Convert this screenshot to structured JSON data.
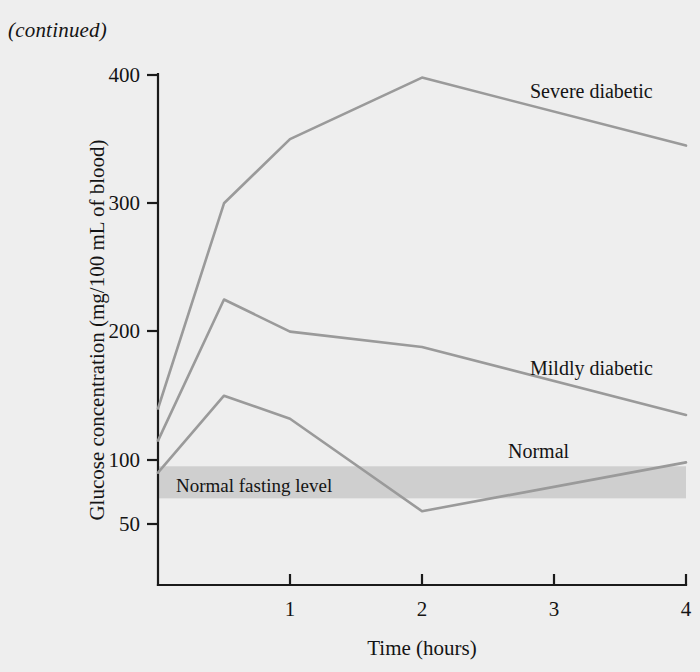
{
  "page": {
    "continued_note": "(continued)",
    "background_color": "#eeeeee"
  },
  "chart_data": {
    "type": "line",
    "title": "",
    "xlabel": "Time (hours)",
    "ylabel": "Glucose concentration (mg/100 mL of blood)",
    "xlim": [
      0,
      4
    ],
    "ylim": [
      30,
      400
    ],
    "xticks": [
      "1",
      "2",
      "3",
      "4"
    ],
    "xtick_values": [
      1,
      2,
      3,
      4
    ],
    "yticks": [
      "400",
      "300",
      "200",
      "100",
      "50"
    ],
    "ytick_values": [
      400,
      300,
      200,
      100,
      50
    ],
    "grid": false,
    "legend_position": "inline-right",
    "x": [
      0,
      0.5,
      1,
      2,
      4
    ],
    "series": [
      {
        "name": "Severe diabetic",
        "color": "#9a9a9a",
        "values": [
          140,
          300,
          350,
          398,
          345
        ],
        "label_x": 3.05,
        "label_y": 372
      },
      {
        "name": "Mildly diabetic",
        "color": "#9a9a9a",
        "values": [
          115,
          225,
          200,
          188,
          135
        ],
        "label_x": 3.05,
        "label_y": 172
      },
      {
        "name": "Normal",
        "color": "#9a9a9a",
        "values": [
          90,
          150,
          132,
          60,
          98
        ],
        "label_x": 3.0,
        "label_y": 108
      }
    ],
    "annotations": [
      {
        "name": "Normal fasting level",
        "type": "hband",
        "y_low": 70,
        "y_high": 95,
        "color": "#cfcfcf",
        "label": "Normal fasting level"
      }
    ]
  }
}
